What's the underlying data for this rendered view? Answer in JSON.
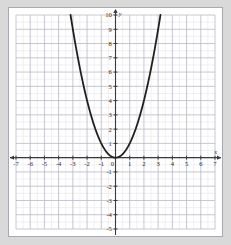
{
  "figure": {
    "background_color": "#d9d9d9",
    "plot_background_color": "#ffffff",
    "plot_border_color": "#9a9a9a"
  },
  "axes": {
    "x_axis_label": "x",
    "y_axis_label": "y",
    "axis_color": "#3a3a3a",
    "major_grid_color": "#b9b9c4",
    "minor_grid_color": "#e6e6ec",
    "x_tick_labels": [
      "-7",
      "-6",
      "-5",
      "-4",
      "-3",
      "-2",
      "-1",
      "0",
      "1",
      "2",
      "3",
      "4",
      "5",
      "6",
      "7"
    ],
    "y_tick_labels": [
      "10",
      "9",
      "8",
      "7",
      "6",
      "5",
      "4",
      "3",
      "2",
      "1",
      "-1",
      "-2",
      "-3",
      "-4",
      "-5"
    ],
    "origin_label": "0"
  },
  "chart_data": {
    "type": "line",
    "title": "",
    "subtitle": "",
    "xlabel": "x",
    "ylabel": "y",
    "xlim": [
      -7,
      7
    ],
    "ylim": [
      -5,
      10
    ],
    "grid": true,
    "minor_grid": true,
    "minor_ticks_per_unit": 2,
    "legend": null,
    "legend_position": "none",
    "annotations": [],
    "series": [
      {
        "name": "y = x^2",
        "equation": "y = x^2",
        "color": "#1f1f1f",
        "line_width": 1.8,
        "vertex": [
          0,
          0
        ],
        "domain_drawn": [
          -3.1623,
          3.1623
        ],
        "x": [
          -3.1623,
          -3.0,
          -2.8,
          -2.6,
          -2.4,
          -2.2,
          -2.0,
          -1.8,
          -1.6,
          -1.4,
          -1.2,
          -1.0,
          -0.8,
          -0.6,
          -0.4,
          -0.2,
          0.0,
          0.2,
          0.4,
          0.6,
          0.8,
          1.0,
          1.2,
          1.4,
          1.6,
          1.8,
          2.0,
          2.2,
          2.4,
          2.6,
          2.8,
          3.0,
          3.1623
        ],
        "y": [
          10.0,
          9.0,
          7.84,
          6.76,
          5.76,
          4.84,
          4.0,
          3.24,
          2.56,
          1.96,
          1.44,
          1.0,
          0.64,
          0.36,
          0.16,
          0.04,
          0.0,
          0.04,
          0.16,
          0.36,
          0.64,
          1.0,
          1.44,
          1.96,
          2.56,
          3.24,
          4.0,
          4.84,
          5.76,
          6.76,
          7.84,
          9.0,
          10.0
        ]
      }
    ]
  }
}
